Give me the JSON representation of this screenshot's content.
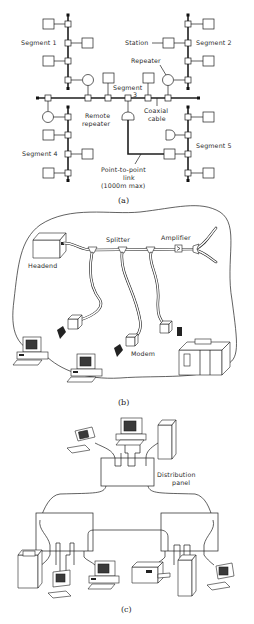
{
  "figure_a": {
    "caption": "(a)",
    "labels": {
      "segment1": "Segment 1",
      "segment2": "Segment 2",
      "segment3_line1": "Segment",
      "segment3_line2": "3",
      "segment4": "Segment 4",
      "segment5": "Segment 5",
      "station": "Station",
      "repeater": "Repeater",
      "remote_repeater_line1": "Remote",
      "remote_repeater_line2": "repeater",
      "coaxial_line1": "Coaxial",
      "coaxial_line2": "cable",
      "p2p_line1": "Point-to-point",
      "p2p_line2": "link",
      "p2p_line3": "(1000m max)"
    }
  },
  "figure_b": {
    "caption": "(b)",
    "labels": {
      "headend": "Headend",
      "splitter": "Splitter",
      "amplifier": "Amplifier",
      "modem": "Modem"
    }
  },
  "figure_c": {
    "caption": "(c)",
    "labels": {
      "distribution_line1": "Distribution",
      "distribution_line2": "panel"
    }
  }
}
